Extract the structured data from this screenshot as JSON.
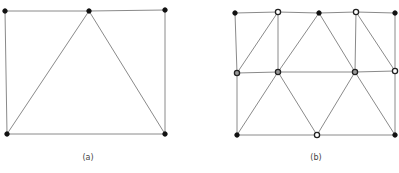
{
  "figures": [
    {
      "id": "a",
      "caption": "(a)",
      "caption_pos": [
        88,
        160
      ],
      "nodes": [
        {
          "x": 5,
          "y": 11,
          "style": "filled"
        },
        {
          "x": 89,
          "y": 11,
          "style": "filled"
        },
        {
          "x": 165,
          "y": 10,
          "style": "filled"
        },
        {
          "x": 7,
          "y": 134,
          "style": "filled"
        },
        {
          "x": 165,
          "y": 134,
          "style": "filled"
        }
      ],
      "edges": [
        [
          0,
          1
        ],
        [
          1,
          2
        ],
        [
          2,
          4
        ],
        [
          4,
          3
        ],
        [
          3,
          0
        ],
        [
          1,
          3
        ],
        [
          1,
          4
        ]
      ]
    },
    {
      "id": "b",
      "caption": "(b)",
      "caption_pos": [
        316,
        160
      ],
      "nodes": [
        {
          "x": 235,
          "y": 13,
          "style": "filled"
        },
        {
          "x": 278,
          "y": 12,
          "style": "open"
        },
        {
          "x": 319,
          "y": 13,
          "style": "filled"
        },
        {
          "x": 356,
          "y": 12,
          "style": "open"
        },
        {
          "x": 395,
          "y": 13,
          "style": "filled"
        },
        {
          "x": 237,
          "y": 73,
          "style": "gray"
        },
        {
          "x": 278,
          "y": 72,
          "style": "gray"
        },
        {
          "x": 355,
          "y": 72,
          "style": "gray"
        },
        {
          "x": 395,
          "y": 71,
          "style": "open"
        },
        {
          "x": 237,
          "y": 135,
          "style": "filled"
        },
        {
          "x": 317,
          "y": 135,
          "style": "open"
        },
        {
          "x": 395,
          "y": 135,
          "style": "filled"
        }
      ],
      "edges": [
        [
          0,
          1
        ],
        [
          1,
          2
        ],
        [
          2,
          3
        ],
        [
          3,
          4
        ],
        [
          0,
          5
        ],
        [
          5,
          9
        ],
        [
          4,
          8
        ],
        [
          8,
          11
        ],
        [
          9,
          10
        ],
        [
          10,
          11
        ],
        [
          5,
          6
        ],
        [
          6,
          7
        ],
        [
          7,
          8
        ],
        [
          1,
          6
        ],
        [
          5,
          1
        ],
        [
          6,
          2
        ],
        [
          2,
          7
        ],
        [
          3,
          7
        ],
        [
          3,
          8
        ],
        [
          6,
          9
        ],
        [
          6,
          10
        ],
        [
          7,
          10
        ],
        [
          7,
          11
        ]
      ]
    }
  ]
}
